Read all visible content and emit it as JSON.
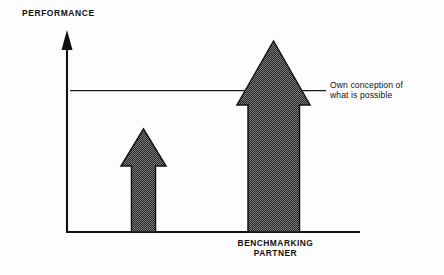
{
  "diagram": {
    "axis": {
      "y_axis_title": "PERFORMANCE",
      "y_axis_name": "performance-axis",
      "x_axis_name": "baseline-axis"
    },
    "reference_line": {
      "label_line1": "Own conception of",
      "label_line2": "what is possible"
    },
    "category": {
      "label_line1": "BENCHMARKING",
      "label_line2": "PARTNER"
    },
    "bars": [
      {
        "name": "own-performance-arrow",
        "description": "shorter upward arrow",
        "height_fraction": 0.47
      },
      {
        "name": "benchmarking-partner-arrow",
        "description": "taller upward arrow exceeding the reference line",
        "height_fraction": 0.95
      }
    ],
    "colors": {
      "ink": "#111111",
      "fill": "#3a3a3a",
      "background": "#ffffff"
    }
  }
}
